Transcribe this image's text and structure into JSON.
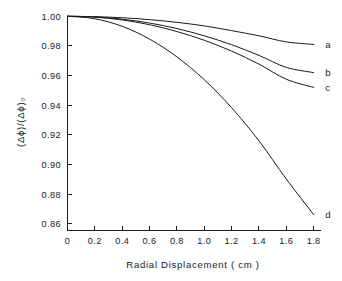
{
  "chart_data": {
    "type": "line",
    "title": "",
    "xlabel": "Radial Displacement ( cm )",
    "ylabel": "(Δϕ)/(Δϕ)₀",
    "xlim": [
      0,
      1.85
    ],
    "ylim": [
      0.8555,
      1.0005
    ],
    "grid": false,
    "legend_position": "right-of-curve-ends",
    "xticks": [
      0,
      0.2,
      0.4,
      0.6,
      0.8,
      1.0,
      1.2,
      1.4,
      1.6,
      1.8
    ],
    "xtick_labels": [
      "0",
      "0.2",
      "0.4",
      "0.6",
      "0.8",
      "1.0",
      "1.2",
      "1.4",
      "1.6",
      "1.8"
    ],
    "yticks": [
      0.86,
      0.88,
      0.9,
      0.92,
      0.94,
      0.96,
      0.98,
      1.0
    ],
    "ytick_labels": [
      "0.86",
      "0.88",
      "0.90",
      "0.92",
      "0.94",
      "0.96",
      "0.98",
      "1.00"
    ],
    "axis_color": "#1a1a1a",
    "curve_color": "#1a1a1a",
    "x": [
      0,
      0.2,
      0.4,
      0.6,
      0.8,
      1.0,
      1.2,
      1.4,
      1.6,
      1.8
    ],
    "series": [
      {
        "name": "a",
        "label": "a",
        "values": [
          1.0,
          0.9997,
          0.999,
          0.9977,
          0.9959,
          0.9935,
          0.9903,
          0.9868,
          0.9827,
          0.981
        ]
      },
      {
        "name": "b",
        "label": "b",
        "values": [
          1.0,
          0.9995,
          0.998,
          0.9954,
          0.9917,
          0.9868,
          0.9808,
          0.9736,
          0.9655,
          0.962
        ]
      },
      {
        "name": "c",
        "label": "c",
        "values": [
          1.0,
          0.9994,
          0.9975,
          0.9943,
          0.9897,
          0.9838,
          0.9765,
          0.9677,
          0.9575,
          0.952
        ]
      },
      {
        "name": "d",
        "label": "d",
        "values": [
          1.0,
          0.9983,
          0.9932,
          0.9846,
          0.9726,
          0.9572,
          0.9383,
          0.916,
          0.8902,
          0.8662
        ]
      }
    ],
    "curve_labels": [
      {
        "text": "a",
        "x": 1.87,
        "y": 0.981
      },
      {
        "text": "b",
        "x": 1.87,
        "y": 0.962
      },
      {
        "text": "c",
        "x": 1.87,
        "y": 0.952
      },
      {
        "text": "d",
        "x": 1.87,
        "y": 0.8662
      }
    ]
  }
}
